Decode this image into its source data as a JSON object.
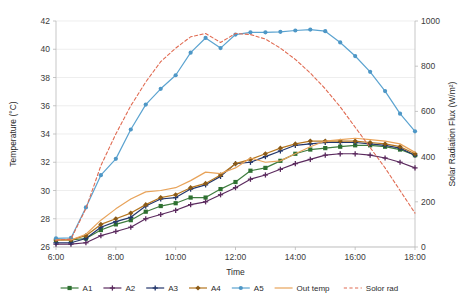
{
  "chart_data": {
    "type": "line",
    "title": "",
    "xlabel": "Time",
    "ylabel": "Temperature (°C)",
    "y2label": "Solar Radiation Flux (W/m²)",
    "grid": true,
    "legend_position": "bottom",
    "ylim": [
      26,
      42
    ],
    "yticks": [
      26,
      28,
      30,
      32,
      34,
      36,
      38,
      40,
      42
    ],
    "y2lim": [
      0,
      1000
    ],
    "y2ticks": [
      0,
      200,
      400,
      600,
      800,
      1000
    ],
    "xlim": [
      6,
      18
    ],
    "xticks": [
      6,
      8,
      10,
      12,
      14,
      16,
      18
    ],
    "xticklabels": [
      "6:00",
      "8:00",
      "10:00",
      "12:00",
      "14:00",
      "16:00",
      "18:00"
    ],
    "x": [
      6,
      6.5,
      7,
      7.5,
      8,
      8.5,
      9,
      9.5,
      10,
      10.5,
      11,
      11.5,
      12,
      12.5,
      13,
      13.5,
      14,
      14.5,
      15,
      15.5,
      16,
      16.5,
      17,
      17.5,
      18
    ],
    "series": [
      {
        "name": "A1",
        "axis": "left",
        "color": "#3f7d3f",
        "marker": "square",
        "marker_color": "#2e7031",
        "dash": "solid",
        "values": [
          26.5,
          26.5,
          26.6,
          27.2,
          27.6,
          27.9,
          28.5,
          28.9,
          29.1,
          29.5,
          29.5,
          30.1,
          30.6,
          31.4,
          31.6,
          32.1,
          32.6,
          32.9,
          33.0,
          33.1,
          33.2,
          33.2,
          33.1,
          32.9,
          32.5
        ]
      },
      {
        "name": "A2",
        "axis": "left",
        "color": "#5b2a5e",
        "marker": "plus",
        "marker_color": "#5b2a5e",
        "dash": "solid",
        "values": [
          26.2,
          26.2,
          26.3,
          26.8,
          27.1,
          27.4,
          28.0,
          28.3,
          28.6,
          29.0,
          29.2,
          29.7,
          30.2,
          30.8,
          31.1,
          31.5,
          31.9,
          32.2,
          32.5,
          32.6,
          32.6,
          32.5,
          32.3,
          32.0,
          31.6
        ]
      },
      {
        "name": "A3",
        "axis": "left",
        "color": "#23366b",
        "marker": "plus",
        "marker_color": "#23366b",
        "dash": "solid",
        "values": [
          26.3,
          26.3,
          26.6,
          27.4,
          27.8,
          28.1,
          28.9,
          29.4,
          29.5,
          30.1,
          30.4,
          31.0,
          31.9,
          32.0,
          32.4,
          32.8,
          33.2,
          33.3,
          33.4,
          33.4,
          33.4,
          33.3,
          33.2,
          33.0,
          32.5
        ]
      },
      {
        "name": "A4",
        "axis": "left",
        "color": "#b5761f",
        "marker": "diamond",
        "marker_color": "#8a5a17",
        "dash": "solid",
        "values": [
          26.5,
          26.5,
          26.8,
          27.6,
          28.0,
          28.4,
          29.0,
          29.5,
          29.7,
          30.2,
          30.5,
          31.1,
          31.9,
          32.2,
          32.6,
          33.0,
          33.3,
          33.5,
          33.5,
          33.5,
          33.5,
          33.4,
          33.3,
          33.1,
          32.6
        ]
      },
      {
        "name": "A5",
        "axis": "right",
        "color": "#5ba3d0",
        "marker": "circle",
        "marker_color": "#4e97c6",
        "dash": "solid",
        "values": [
          38,
          40,
          175,
          318,
          390,
          520,
          630,
          700,
          760,
          860,
          925,
          880,
          940,
          950,
          950,
          952,
          958,
          962,
          955,
          905,
          845,
          775,
          690,
          590,
          512
        ]
      },
      {
        "name": "Out temp",
        "axis": "left",
        "color": "#e8a35a",
        "marker": "none",
        "marker_color": "#e8a35a",
        "dash": "solid",
        "values": [
          26.5,
          26.5,
          26.9,
          27.9,
          28.7,
          29.4,
          29.9,
          30.0,
          30.2,
          30.7,
          31.3,
          31.2,
          31.6,
          32.3,
          32.0,
          32.1,
          32.6,
          33.1,
          33.5,
          33.6,
          33.7,
          33.6,
          33.5,
          33.3,
          32.7
        ]
      },
      {
        "name": "Solor rad",
        "axis": "right",
        "color": "#e06b52",
        "marker": "none",
        "marker_color": "#e06b52",
        "dash": "dashed",
        "values": [
          30,
          35,
          170,
          360,
          500,
          625,
          730,
          820,
          880,
          930,
          945,
          905,
          945,
          940,
          920,
          880,
          830,
          770,
          700,
          620,
          530,
          440,
          350,
          250,
          150
        ]
      }
    ]
  },
  "legend": [
    {
      "label": "A1"
    },
    {
      "label": "A2"
    },
    {
      "label": "A3"
    },
    {
      "label": "A4"
    },
    {
      "label": "A5"
    },
    {
      "label": "Out temp"
    },
    {
      "label": "Solor rad"
    }
  ]
}
